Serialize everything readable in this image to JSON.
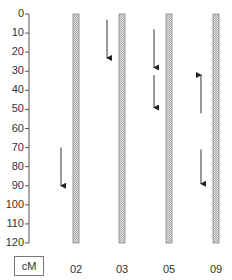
{
  "diagram": {
    "type": "genetic-linkage-map",
    "axis": {
      "unit": "cM",
      "min": 0,
      "max": 120,
      "ticks": [
        0,
        10,
        20,
        30,
        40,
        50,
        60,
        70,
        80,
        90,
        100,
        110,
        120
      ],
      "tick_labels": [
        "0",
        "10",
        "20",
        "30",
        "40",
        "50",
        "60",
        "70",
        "80",
        "90",
        "100",
        "110",
        "120"
      ]
    },
    "chromosomes": [
      {
        "label": "02",
        "start": 0,
        "end": 120,
        "arrows": [
          {
            "from": 70,
            "to": 90,
            "direction": "down"
          }
        ]
      },
      {
        "label": "03",
        "start": 0,
        "end": 120,
        "arrows": [
          {
            "from": 3,
            "to": 23,
            "direction": "down"
          }
        ]
      },
      {
        "label": "05",
        "start": 0,
        "end": 120,
        "arrows": [
          {
            "from": 8,
            "to": 28,
            "direction": "down"
          },
          {
            "from": 32,
            "to": 49,
            "direction": "down"
          }
        ]
      },
      {
        "label": "09",
        "start": 0,
        "end": 120,
        "arrows": [
          {
            "from": 52,
            "to": 32,
            "direction": "up"
          },
          {
            "from": 71,
            "to": 89,
            "direction": "down"
          }
        ]
      }
    ],
    "colors": {
      "bar_fill": "#d8d8d8",
      "bar_stroke": "#888888",
      "arrow": "#333333",
      "axis": "#555555"
    }
  }
}
